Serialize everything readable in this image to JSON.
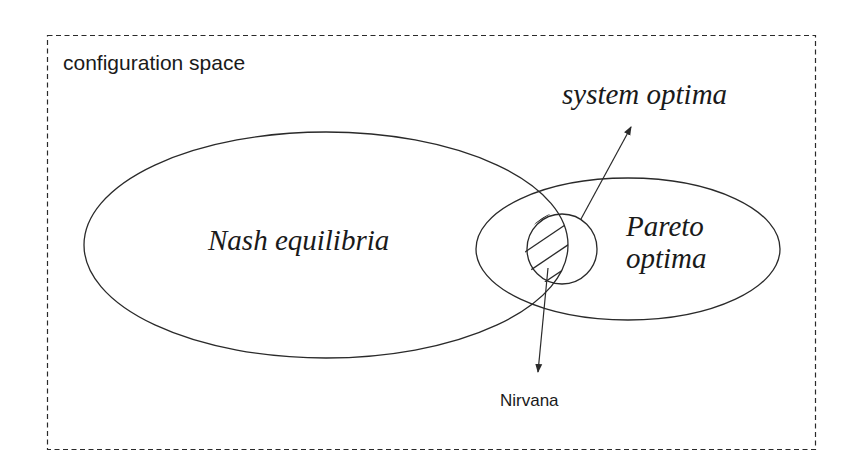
{
  "diagram": {
    "frame_label": "configuration space",
    "regions": {
      "nash": {
        "label": "Nash equilibria"
      },
      "pareto": {
        "label_line1": "Pareto",
        "label_line2": "optima"
      },
      "system": {
        "label": "system optima"
      },
      "nirvana": {
        "label": "Nirvana"
      }
    },
    "colors": {
      "stroke": "#2a2a2a",
      "background": "#ffffff",
      "text": "#1a1a1a"
    }
  }
}
